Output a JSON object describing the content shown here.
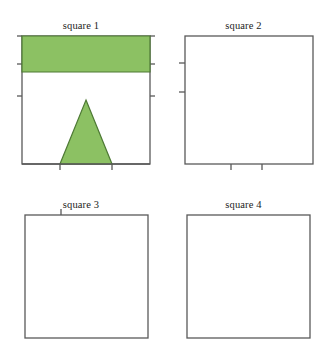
{
  "figure": {
    "layout": {
      "rows": 2,
      "columns": 2,
      "width": 325,
      "height": 358,
      "background": "#ffffff"
    },
    "stroke_color": "#595959",
    "tick_color": "#595959",
    "panels": [
      {
        "id": "square-1",
        "title": "square 1",
        "fill_color": "#8CC163",
        "shape_kind": "rectangle-and-triangle",
        "square": {
          "x": 22,
          "y": 36,
          "size": 128
        },
        "shapes": [
          {
            "name": "green-rectangle",
            "type": "rectangle",
            "points": "22,36 150,36 150,72 22,72"
          },
          {
            "name": "green-triangle",
            "type": "triangle",
            "points": "86,100 112,164 60,164"
          }
        ],
        "ticks": {
          "left": [
            72,
            100,
            132
          ],
          "right": [
            72,
            100,
            132
          ],
          "bottom": [
            60,
            112
          ],
          "top": []
        }
      },
      {
        "id": "square-2",
        "title": "square 2",
        "fill_color": "#D9607C",
        "shape_kind": "hexagon",
        "square": {
          "x": 185,
          "y": 36,
          "size": 128
        },
        "shapes": [
          {
            "name": "pink-hexagon",
            "type": "hexagon",
            "points": "185,36 268,36 313,113 313,164 231,164 185,99"
          }
        ],
        "ticks": {
          "left": [
            99,
            128
          ],
          "right": [],
          "bottom": [
            231,
            262
          ],
          "top": []
        }
      },
      {
        "id": "square-3",
        "title": "square 3",
        "fill_color": "#6DAEDC",
        "shape_kind": "arrow-chevron",
        "square": {
          "x": 25,
          "y": 215,
          "size": 123
        },
        "shapes": [
          {
            "name": "blue-arrow",
            "type": "chevron",
            "points": "86,215 148,338 86,292 25,338"
          }
        ],
        "ticks": {
          "left": [],
          "right": [],
          "bottom": [],
          "top": [
            86
          ]
        }
      },
      {
        "id": "square-4",
        "title": "square 4",
        "fill_color": "#E0E169",
        "shape_kind": "triangle",
        "square": {
          "x": 188,
          "y": 215,
          "size": 123
        },
        "shapes": [
          {
            "name": "yellow-triangle",
            "type": "triangle",
            "points": "188,215 311,290 255,338"
          }
        ],
        "ticks": {
          "left": [],
          "right": [],
          "bottom": [],
          "top": []
        }
      }
    ]
  }
}
